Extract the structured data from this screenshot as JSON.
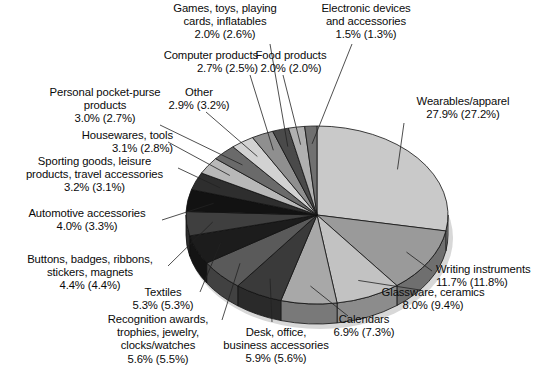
{
  "chart_data": {
    "type": "pie",
    "title": "",
    "subtitle": "",
    "xlabel": "",
    "ylabel": "",
    "legend_position": "none",
    "grid": false,
    "value_suffix": "%",
    "note": "Each label shows current-year percent with prior-year percent in parentheses.",
    "categories": [
      "Wearables/apparel",
      "Writing instruments",
      "Glassware, ceramics",
      "Calendars",
      "Desk, office, business accessories",
      "Recognition awards, trophies, jewelry, clocks/watches",
      "Textiles",
      "Buttons, badges, ribbons, stickers, magnets",
      "Automotive accessories",
      "Sporting goods, leisure products, travel accessories",
      "Housewares, tools",
      "Personal pocket-purse products",
      "Other",
      "Computer products",
      "Games, toys, playing cards, inflatables",
      "Food products",
      "Electronic devices and accessories"
    ],
    "values": [
      27.9,
      11.7,
      8.0,
      6.9,
      5.9,
      5.6,
      5.3,
      4.4,
      4.0,
      3.2,
      3.1,
      3.0,
      2.9,
      2.7,
      2.0,
      2.0,
      1.5
    ],
    "values_prior": [
      27.2,
      11.8,
      9.4,
      7.3,
      5.6,
      5.5,
      5.3,
      4.4,
      3.3,
      3.1,
      2.8,
      2.7,
      3.2,
      2.5,
      2.6,
      2.0,
      1.3
    ],
    "slice_colors": [
      "#c9c9c9",
      "#9a9a9a",
      "#c2c2c2",
      "#a8a8a8",
      "#3a3a3a",
      "#5a5a5a",
      "#1c1c1c",
      "#3f3f3f",
      "#121212",
      "#2e2e2e",
      "#b8b8b8",
      "#6a6a6a",
      "#d2d2d2",
      "#8f8f8f",
      "#4a4a4a",
      "#b0b0b0",
      "#707070"
    ]
  },
  "labels": [
    {
      "name": "games-toys",
      "lines": [
        "Games, toys, playing",
        "cards, inflatables",
        "2.0% (2.6%)"
      ]
    },
    {
      "name": "electronic-devices",
      "lines": [
        "Electronic devices",
        "and accessories",
        "1.5% (1.3%)"
      ]
    },
    {
      "name": "computer-products",
      "lines": [
        "Computer products",
        "2.7% (2.5%)"
      ]
    },
    {
      "name": "food-products",
      "lines": [
        "Food products",
        "2.0% (2.0%)"
      ]
    },
    {
      "name": "personal-pocket-purse",
      "lines": [
        "Personal pocket-purse",
        "products",
        "3.0% (2.7%)"
      ]
    },
    {
      "name": "other",
      "lines": [
        "Other",
        "2.9% (3.2%)"
      ]
    },
    {
      "name": "wearables-apparel",
      "lines": [
        "Wearables/apparel",
        "27.9% (27.2%)"
      ]
    },
    {
      "name": "housewares-tools",
      "lines": [
        "Housewares, tools",
        "3.1% (2.8%)"
      ]
    },
    {
      "name": "sporting-goods",
      "lines": [
        "Sporting goods, leisure",
        "products, travel accessories",
        "3.2% (3.1%)"
      ]
    },
    {
      "name": "automotive-accessories",
      "lines": [
        "Automotive accessories",
        "4.0% (3.3%)"
      ]
    },
    {
      "name": "buttons-badges",
      "lines": [
        "Buttons, badges, ribbons,",
        "stickers, magnets",
        "4.4% (4.4%)"
      ]
    },
    {
      "name": "textiles",
      "lines": [
        "Textiles",
        "5.3% (5.3%)"
      ]
    },
    {
      "name": "recognition-awards",
      "lines": [
        "Recognition awards,",
        "trophies, jewelry,",
        "clocks/watches",
        "5.6% (5.5%)"
      ]
    },
    {
      "name": "desk-office",
      "lines": [
        "Desk, office,",
        "business accessories",
        "5.9% (5.6%)"
      ]
    },
    {
      "name": "calendars",
      "lines": [
        "Calendars",
        "6.9% (7.3%)"
      ]
    },
    {
      "name": "glassware-ceramics",
      "lines": [
        "Glassware, ceramics",
        "8.0% (9.4%)"
      ]
    },
    {
      "name": "writing-instruments",
      "lines": [
        "Writing instruments",
        "11.7% (11.8%)"
      ]
    }
  ]
}
